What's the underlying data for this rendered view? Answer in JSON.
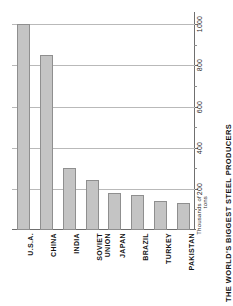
{
  "chart_data": {
    "type": "bar",
    "title": "THE WORLD'S BIGGEST STEEL PRODUCERS",
    "xlabel": "",
    "ylabel": "Thousands of tons",
    "orientation": "vertical-rotated",
    "categories": [
      "U.S.A.",
      "CHINA",
      "INDIA",
      "SOVIET\nUNION",
      "JAPAN",
      "BRAZIL",
      "TURKEY",
      "PAKISTAN"
    ],
    "values": [
      1000,
      850,
      300,
      245,
      180,
      172,
      140,
      133
    ],
    "ylim": [
      0,
      1060
    ],
    "yticks": [
      200,
      400,
      600,
      800,
      1000
    ],
    "ytick_labels": [
      "200",
      "400",
      "600",
      "800",
      "1000"
    ],
    "minor_yticks": [
      100,
      300,
      500,
      700,
      900
    ],
    "grid": true,
    "legend": false,
    "bar_color": "#c4c4c4",
    "bar_edge_color": "#8f8f8f",
    "grid_color": "#b9b9b9",
    "axis_color": "#6f6f6f",
    "axis_position": "right"
  },
  "axis": {
    "y_title": "Thousands of tons"
  }
}
